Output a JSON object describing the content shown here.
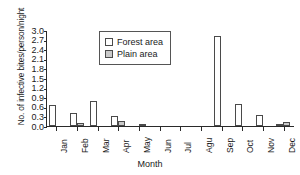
{
  "chart_data": {
    "type": "bar",
    "title": "",
    "xlabel": "Month",
    "ylabel": "No. of infective bites/person/night",
    "categories": [
      "Jan",
      "Feb",
      "Mar",
      "Apr",
      "May",
      "Jun",
      "Jul",
      "Agu",
      "Sep",
      "Oct",
      "Nov",
      "Dec"
    ],
    "series": [
      {
        "name": "Forest area",
        "color": "#ffffff",
        "values": [
          0.66,
          0.42,
          0.78,
          0.31,
          0.0,
          0.0,
          0.0,
          0.0,
          2.8,
          0.69,
          0.34,
          0.07
        ]
      },
      {
        "name": "Plain area",
        "color": "#c9c9c9",
        "values": [
          0.0,
          0.08,
          0.0,
          0.17,
          0.06,
          0.0,
          0.0,
          0.0,
          0.0,
          0.0,
          0.0,
          0.13
        ]
      }
    ],
    "ylim": [
      0.0,
      3.0
    ],
    "ytick_values": [
      0.0,
      0.3,
      0.6,
      0.9,
      1.2,
      1.5,
      1.8,
      2.1,
      2.4,
      2.7,
      3.0
    ],
    "ytick_labels": [
      "0.0",
      "0.3",
      "0.6",
      "0.9",
      "1.2",
      "1.5",
      "1.8",
      "2.1",
      "2.4",
      "2.7",
      "3.0"
    ],
    "grid": false,
    "legend_position": "top-center"
  }
}
